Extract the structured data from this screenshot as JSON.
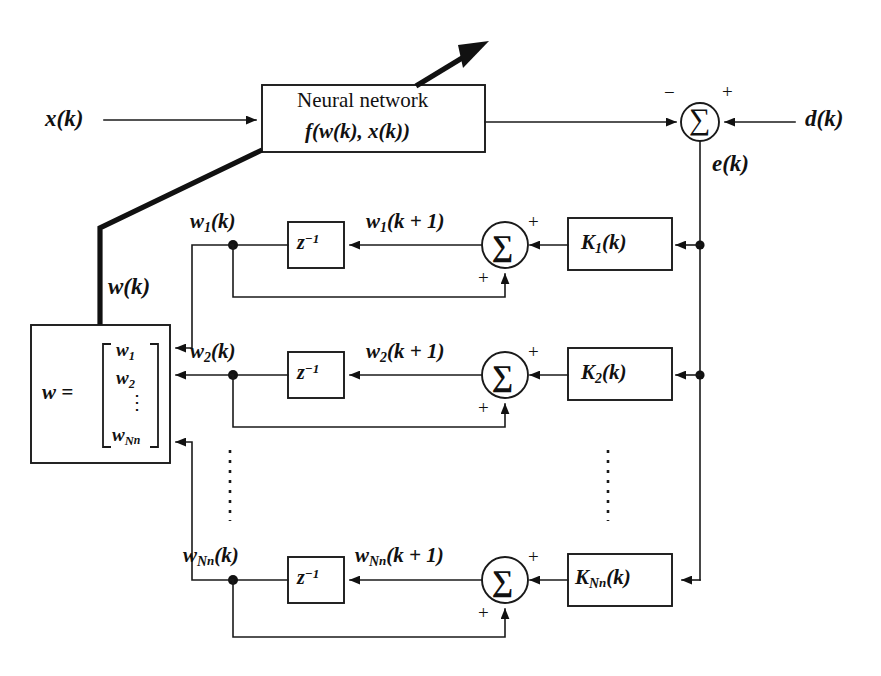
{
  "diagram": {
    "signals": {
      "input": "x(k)",
      "desired": "d(k)",
      "error": "e(k)",
      "weight_vector": "w(k)"
    },
    "neural_network_block": {
      "title": "Neural network",
      "function": "f(w(k), x(k))"
    },
    "weight_box": {
      "label": "w =",
      "entries": [
        "w1",
        "w2",
        "vdots",
        "wNn"
      ],
      "entry_1": "w",
      "entry_1_sub": "1",
      "entry_2": "w",
      "entry_2_sub": "2",
      "entry_n": "w",
      "entry_n_sub": "N",
      "entry_n_subsub": "n"
    },
    "summing_junction": {
      "glyph": "∑",
      "main_left_sign": "−",
      "main_right_sign": "+",
      "row_right_sign": "+",
      "row_bottom_sign": "+"
    },
    "delay_block_label": "z⁻¹",
    "delay_base": "z",
    "delay_exp": "−1",
    "rows": [
      {
        "index": "1",
        "state_label": "w",
        "state_sub": "1",
        "state_arg": "(k)",
        "next_label": "w",
        "next_sub": "1",
        "next_arg": "(k + 1)",
        "gain_label": "K",
        "gain_sub": "1",
        "gain_arg": "(k)"
      },
      {
        "index": "2",
        "state_label": "w",
        "state_sub": "2",
        "state_arg": "(k)",
        "next_label": "w",
        "next_sub": "2",
        "next_arg": "(k + 1)",
        "gain_label": "K",
        "gain_sub": "2",
        "gain_arg": "(k)"
      },
      {
        "index": "Nn",
        "state_label": "w",
        "state_sub": "N",
        "state_subsub": "n",
        "state_arg": "(k)",
        "next_label": "w",
        "next_sub": "N",
        "next_subsub": "n",
        "next_arg": "(k + 1)",
        "gain_label": "K",
        "gain_sub": "N",
        "gain_subsub": "n",
        "gain_arg": "(k)"
      }
    ],
    "ellipsis_marker": "⋮",
    "colors": {
      "line": "#1a1a1a",
      "fill": "#ffffff",
      "ink": "#111111"
    }
  }
}
